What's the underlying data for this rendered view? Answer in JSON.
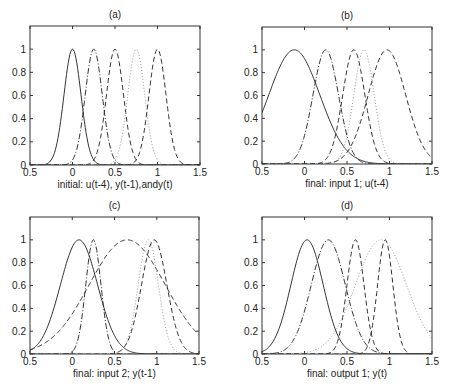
{
  "figure": {
    "width": 451,
    "height": 392,
    "line_color": "#333333",
    "dotted_color": "#9a9a9a"
  },
  "chart_data": [
    {
      "type": "line",
      "panel": "(a)",
      "title": "(a)",
      "xlabel": "initial: u(t-4), y(t-1),andy(t)",
      "ylabel": "",
      "xlim": [
        -0.5,
        1.5
      ],
      "ylim": [
        0,
        1.2
      ],
      "xticks": [
        -0.5,
        0,
        0.5,
        1,
        1.5
      ],
      "xtick_labels": [
        "0.5",
        "0",
        "0.5",
        "1",
        "1.5"
      ],
      "yticks": [
        0,
        0.2,
        0.4,
        0.6,
        0.8,
        1
      ],
      "ytick_labels": [
        "0",
        "0.2",
        "0.4",
        "0.6",
        "0.8",
        "1"
      ],
      "grid": false,
      "frame": {
        "left": 30,
        "top": 26,
        "right": 200,
        "bottom": 165
      },
      "series": [
        {
          "name": "mf1",
          "style": "solid",
          "shape": "gaussian",
          "center": 0.0,
          "sigma": 0.1
        },
        {
          "name": "mf2",
          "style": "dashdot",
          "shape": "gaussian",
          "center": 0.25,
          "sigma": 0.1
        },
        {
          "name": "mf3",
          "style": "dashed",
          "shape": "gaussian",
          "center": 0.5,
          "sigma": 0.1
        },
        {
          "name": "mf4",
          "style": "dotted",
          "shape": "gaussian",
          "center": 0.75,
          "sigma": 0.1
        },
        {
          "name": "mf5",
          "style": "dashed",
          "shape": "gaussian",
          "center": 1.0,
          "sigma": 0.1
        }
      ]
    },
    {
      "type": "line",
      "panel": "(b)",
      "title": "(b)",
      "xlabel": "final: input 1; u(t-4)",
      "ylabel": "",
      "xlim": [
        -0.5,
        1.5
      ],
      "ylim": [
        0,
        1.2
      ],
      "xticks": [
        -0.5,
        0,
        0.5,
        1,
        1.5
      ],
      "xtick_labels": [
        "0.5",
        "0",
        "0.5",
        "1",
        "1.5"
      ],
      "yticks": [
        0,
        0.2,
        0.4,
        0.6,
        0.8,
        1
      ],
      "ytick_labels": [
        "0",
        "0.2",
        "0.4",
        "0.6",
        "0.8",
        "1"
      ],
      "grid": false,
      "frame": {
        "left": 262,
        "top": 27,
        "right": 432,
        "bottom": 164
      },
      "series": [
        {
          "name": "mf1",
          "style": "solid",
          "shape": "gaussian",
          "center": -0.12,
          "sigma": 0.3
        },
        {
          "name": "mf2",
          "style": "dashdot",
          "shape": "gaussian",
          "center": 0.25,
          "sigma": 0.15
        },
        {
          "name": "mf3",
          "style": "dashed",
          "shape": "gaussian",
          "center": 0.58,
          "sigma": 0.13
        },
        {
          "name": "mf4",
          "style": "dotted",
          "shape": "gaussian",
          "center": 0.7,
          "sigma": 0.12
        },
        {
          "name": "mf5",
          "style": "dashed",
          "shape": "gaussian",
          "center": 0.97,
          "sigma": 0.22
        }
      ]
    },
    {
      "type": "line",
      "panel": "(c)",
      "title": "(c)",
      "xlabel": "final: input 2; y(t-1)",
      "ylabel": "",
      "xlim": [
        -0.5,
        1.5
      ],
      "ylim": [
        0,
        1.2
      ],
      "xticks": [
        -0.5,
        0,
        0.5,
        1,
        1.5
      ],
      "xtick_labels": [
        "0.5",
        "0",
        "0.5",
        "1",
        "1.5"
      ],
      "yticks": [
        0,
        0.2,
        0.4,
        0.6,
        0.8,
        1
      ],
      "ytick_labels": [
        "0",
        "0.2",
        "0.4",
        "0.6",
        "0.8",
        "1"
      ],
      "grid": false,
      "frame": {
        "left": 30,
        "top": 217,
        "right": 199,
        "bottom": 354
      },
      "series": [
        {
          "name": "mf1",
          "style": "solid",
          "shape": "gaussian",
          "center": 0.08,
          "sigma": 0.22
        },
        {
          "name": "mf2",
          "style": "dashdot",
          "shape": "gaussian",
          "center": 0.25,
          "sigma": 0.09
        },
        {
          "name": "mf3",
          "style": "dashed",
          "shape": "gaussian",
          "center": 0.65,
          "sigma": 0.45
        },
        {
          "name": "mf4",
          "style": "dotted",
          "shape": "gaussian",
          "center": 0.9,
          "sigma": 0.12
        },
        {
          "name": "mf5",
          "style": "dashed",
          "shape": "gaussian",
          "center": 0.97,
          "sigma": 0.15
        }
      ]
    },
    {
      "type": "line",
      "panel": "(d)",
      "title": "(d)",
      "xlabel": "final: output 1; y(t)",
      "ylabel": "",
      "xlim": [
        -0.5,
        1.5
      ],
      "ylim": [
        0,
        1.2
      ],
      "xticks": [
        -0.5,
        0,
        0.5,
        1,
        1.5
      ],
      "xtick_labels": [
        "0.5",
        "0",
        "0.5",
        "1",
        "1.5"
      ],
      "yticks": [
        0,
        0.2,
        0.4,
        0.6,
        0.8,
        1
      ],
      "ytick_labels": [
        "0",
        "0.2",
        "0.4",
        "0.6",
        "0.8",
        "1"
      ],
      "grid": false,
      "frame": {
        "left": 262,
        "top": 217,
        "right": 432,
        "bottom": 354
      },
      "series": [
        {
          "name": "mf1",
          "style": "solid",
          "shape": "gaussian",
          "center": 0.03,
          "sigma": 0.19
        },
        {
          "name": "mf2",
          "style": "dashdot",
          "shape": "gaussian",
          "center": 0.28,
          "sigma": 0.2
        },
        {
          "name": "mf3",
          "style": "dashed",
          "shape": "gaussian",
          "center": 0.6,
          "sigma": 0.1
        },
        {
          "name": "mf4",
          "style": "dotted",
          "shape": "gaussian",
          "center": 0.9,
          "sigma": 0.3
        },
        {
          "name": "mf5",
          "style": "dashed",
          "shape": "gaussian",
          "center": 0.95,
          "sigma": 0.09
        }
      ]
    }
  ]
}
